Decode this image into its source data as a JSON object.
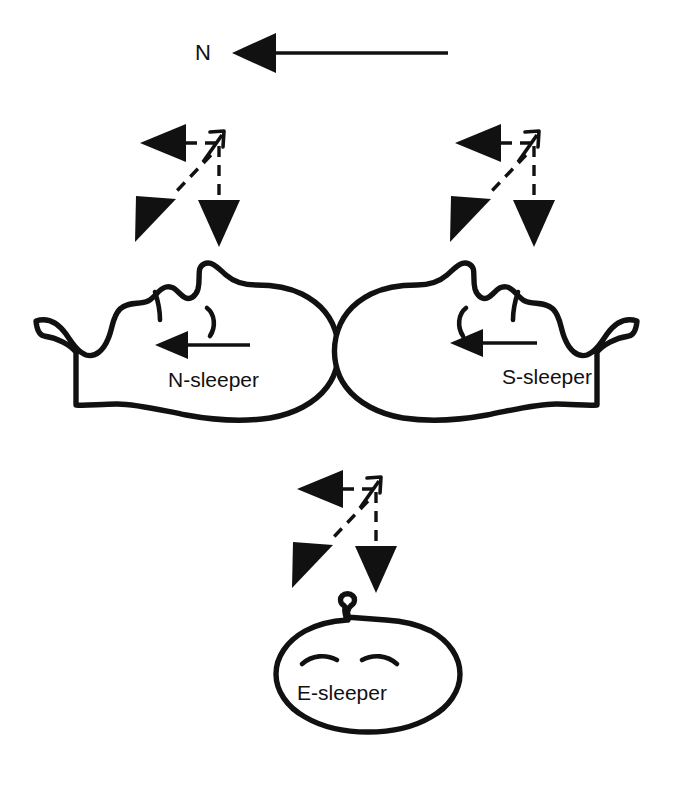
{
  "figure": {
    "background_color": "#ffffff",
    "ink_color": "#111111",
    "width": 673,
    "height": 788
  },
  "compass": {
    "label": "N",
    "arrow_name": "north-reference-arrow",
    "arrow_direction": "left",
    "arrow_style": "solid",
    "tip_x": 232,
    "tail_x": 448,
    "y": 53
  },
  "sleepers": [
    {
      "id": "n-sleeper",
      "label": "N-sleeper",
      "view": "profile",
      "facing": "left",
      "gaze_arrow_direction": "left",
      "gaze_arrow_style": "solid",
      "label_x": 168,
      "label_y": 381
    },
    {
      "id": "s-sleeper",
      "label": "S-sleeper",
      "view": "profile",
      "facing": "right",
      "gaze_arrow_direction": "left",
      "gaze_arrow_style": "solid",
      "label_x": 547,
      "label_y": 378
    },
    {
      "id": "e-sleeper",
      "label": "E-sleeper",
      "view": "from-above",
      "facing": "viewer",
      "gaze_arrow_direction": "none",
      "gaze_arrow_style": "none",
      "label_x": 342,
      "label_y": 694
    }
  ],
  "arrow_clusters": [
    {
      "id": "cluster-n-sleeper",
      "for": "n-sleeper",
      "vertex_x": 218,
      "vertex_y": 143,
      "arrows": [
        {
          "name": "west-arrow",
          "direction": "west",
          "head": "large-filled",
          "dashed": true
        },
        {
          "name": "northeast-arrow",
          "direction": "northeast",
          "head": "small-open",
          "dashed": false
        },
        {
          "name": "south-arrow",
          "direction": "south",
          "head": "large-filled",
          "dashed": true
        },
        {
          "name": "southwest-arrow",
          "direction": "southwest",
          "head": "large-filled",
          "dashed": true
        }
      ]
    },
    {
      "id": "cluster-s-sleeper",
      "for": "s-sleeper",
      "vertex_x": 533,
      "vertex_y": 143,
      "arrows": [
        {
          "name": "west-arrow",
          "direction": "west",
          "head": "large-filled",
          "dashed": true
        },
        {
          "name": "northeast-arrow",
          "direction": "northeast",
          "head": "small-open",
          "dashed": false
        },
        {
          "name": "south-arrow",
          "direction": "south",
          "head": "large-filled",
          "dashed": true
        },
        {
          "name": "southwest-arrow",
          "direction": "southwest",
          "head": "large-filled",
          "dashed": true
        }
      ]
    },
    {
      "id": "cluster-e-sleeper",
      "for": "e-sleeper",
      "vertex_x": 375,
      "vertex_y": 489,
      "arrows": [
        {
          "name": "west-arrow",
          "direction": "west",
          "head": "large-filled",
          "dashed": true
        },
        {
          "name": "northeast-arrow",
          "direction": "northeast",
          "head": "small-open",
          "dashed": false
        },
        {
          "name": "south-arrow",
          "direction": "south",
          "head": "large-filled",
          "dashed": true
        },
        {
          "name": "southwest-arrow",
          "direction": "southwest",
          "head": "large-filled",
          "dashed": true
        }
      ]
    }
  ]
}
